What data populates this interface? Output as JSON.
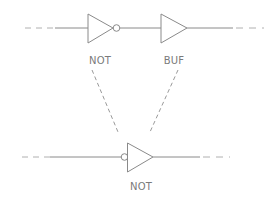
{
  "diagram": {
    "type": "logic-gate-equivalence",
    "stroke_color": "#8a8a8a",
    "background": "#ffffff",
    "top_circuit": {
      "gates": [
        {
          "id": "top-not",
          "kind": "NOT",
          "label": "NOT",
          "bubble": "output"
        },
        {
          "id": "top-buf",
          "kind": "BUF",
          "label": "BUF",
          "bubble": "none"
        }
      ],
      "wires": [
        "dashed-input",
        "solid-input",
        "not-to-buf",
        "solid-output",
        "dashed-output"
      ]
    },
    "bottom_circuit": {
      "gates": [
        {
          "id": "bottom-not",
          "kind": "NOT",
          "label": "NOT",
          "bubble": "input"
        }
      ],
      "wires": [
        "dashed-input",
        "solid-input",
        "solid-output",
        "dashed-output"
      ]
    },
    "connectors": [
      {
        "from": "top-not",
        "to": "bottom-not",
        "style": "dashed"
      },
      {
        "from": "top-buf",
        "to": "bottom-not",
        "style": "dashed"
      }
    ]
  }
}
